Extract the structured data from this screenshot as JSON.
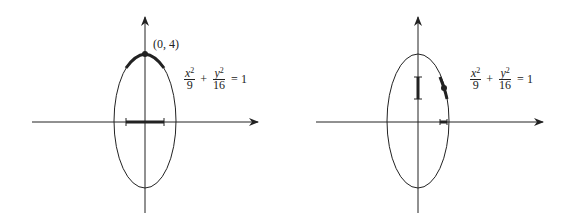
{
  "panels": [
    {
      "id": "left",
      "point_label": "(0, 4)",
      "equation": {
        "term1_num": "x",
        "term1_exp": "2",
        "term1_den": "9",
        "plus": "+",
        "term2_num": "y",
        "term2_exp": "2",
        "term2_den": "16",
        "equals": "=",
        "rhs": "1"
      }
    },
    {
      "id": "right",
      "equation": {
        "term1_num": "x",
        "term1_exp": "2",
        "term1_den": "9",
        "plus": "+",
        "term2_num": "y",
        "term2_exp": "2",
        "term2_den": "16",
        "equals": "=",
        "rhs": "1"
      }
    }
  ],
  "colors": {
    "ink": "#222222",
    "background": "#ffffff"
  }
}
